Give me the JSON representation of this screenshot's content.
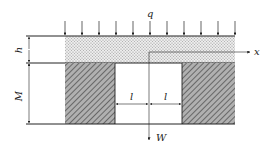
{
  "diagram": {
    "type": "mining-stratum-cross-section",
    "labels": {
      "load": "q",
      "stratum_thickness": "h",
      "seam_height": "M",
      "half_span_left": "l",
      "half_span_right": "l",
      "x_axis": "x",
      "deflection_axis": "W"
    },
    "load_arrow_count": 11,
    "components": [
      "distributed-load-q",
      "overlying-stratum-dotted",
      "left-coal-pillar-hatched",
      "right-coal-pillar-hatched",
      "mined-opening",
      "x-axis",
      "w-axis",
      "dimension-h",
      "dimension-M",
      "dimension-l-left",
      "dimension-l-right"
    ],
    "colors": {
      "line": "#222222",
      "stratum_fill": "#d8d8d8",
      "pillar_fill": "#9a9a9a",
      "background": "#ffffff"
    }
  }
}
